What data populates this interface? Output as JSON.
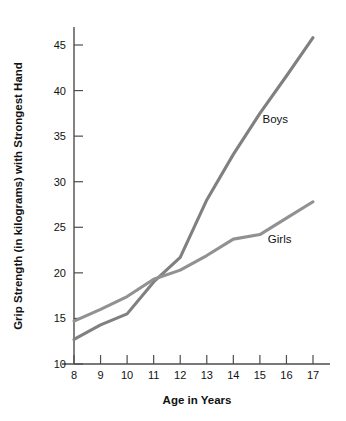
{
  "chart_data": {
    "type": "line",
    "title": "",
    "xlabel": "Age in Years",
    "ylabel": "Grip Strength (in kilograms) with Strongest Hand",
    "x": [
      8,
      9,
      10,
      11,
      12,
      13,
      14,
      15,
      16,
      17
    ],
    "xtick_labels": [
      "8",
      "9",
      "10",
      "11",
      "12",
      "13",
      "14",
      "15",
      "16",
      "17"
    ],
    "ytick_labels": [
      "10",
      "15",
      "20",
      "25",
      "30",
      "35",
      "40",
      "45"
    ],
    "yticks": [
      10,
      15,
      20,
      25,
      30,
      35,
      40,
      45
    ],
    "xlim": [
      8,
      17
    ],
    "ylim": [
      10,
      46.8
    ],
    "grid": false,
    "legend_position": "inline-annotation",
    "series": [
      {
        "name": "Boys",
        "color": "#808080",
        "values": [
          12.7,
          14.3,
          15.5,
          19.0,
          21.7,
          28.0,
          33.0,
          37.5,
          41.6,
          45.8
        ],
        "label_x": 15.1,
        "label_y": 36.4
      },
      {
        "name": "Girls",
        "color": "#919191",
        "values": [
          14.7,
          16.0,
          17.4,
          19.3,
          20.3,
          21.9,
          23.7,
          24.2,
          26.0,
          27.8
        ],
        "label_x": 15.3,
        "label_y": 23.3
      }
    ],
    "annotations": [
      {
        "text": "Boys",
        "x": 15.1,
        "y": 36.4
      },
      {
        "text": "Girls",
        "x": 15.3,
        "y": 23.3
      }
    ],
    "colors": {
      "line_primary": "#808080",
      "line_secondary": "#919191",
      "axis": "#4d4d4d",
      "text": "#111111",
      "background": "#ffffff"
    }
  }
}
